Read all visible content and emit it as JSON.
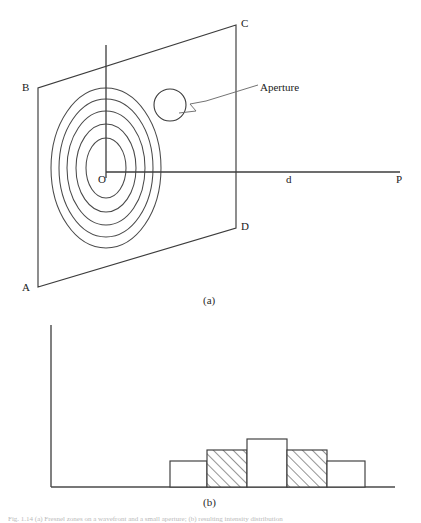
{
  "figure": {
    "caption": "Fig. 1.14   (a) Fresnel zones on a wavefront and a small aperture; (b) resulting intensity distribution",
    "panels": [
      {
        "tag": "(a)",
        "name": "fresnel-zone-diagram"
      },
      {
        "tag": "(b)",
        "name": "intensity-distribution-chart"
      }
    ]
  },
  "diagram": {
    "screen_corner_labels": {
      "a": "A",
      "b": "B",
      "c": "C",
      "d": "D"
    },
    "origin_label": "O",
    "axis_distance_label": "d",
    "axis_point_label": "P",
    "aperture_label": "Aperture",
    "zone_ring_count": 5,
    "colors": {
      "line": "#3c3c3c",
      "ring": "#4a4a4a",
      "leader": "#6b6b6b",
      "text": "#1a1a1a"
    }
  },
  "chart_data": {
    "type": "bar",
    "title": "",
    "subtitle": "",
    "xlabel": "",
    "ylabel": "",
    "grid": false,
    "legend": false,
    "categories": [
      "-2",
      "-1",
      "0",
      "1",
      "2"
    ],
    "tick_labels": [],
    "values": [
      26,
      37,
      48,
      37,
      26
    ],
    "ylim": [
      0,
      100
    ],
    "xlim": [
      0,
      100
    ],
    "bar_fill_patterns": [
      "solid",
      "hatched",
      "solid",
      "hatched",
      "solid"
    ],
    "series": [
      {
        "name": "Diffracted intensity",
        "values": [
          26,
          37,
          48,
          37,
          26
        ]
      }
    ],
    "annotations": [],
    "colors": {
      "axis": "#4a4a4a",
      "bar_outline": "#3c3c3c",
      "bar_fill": "#ffffff",
      "hatch": "#3c3c3c"
    }
  }
}
